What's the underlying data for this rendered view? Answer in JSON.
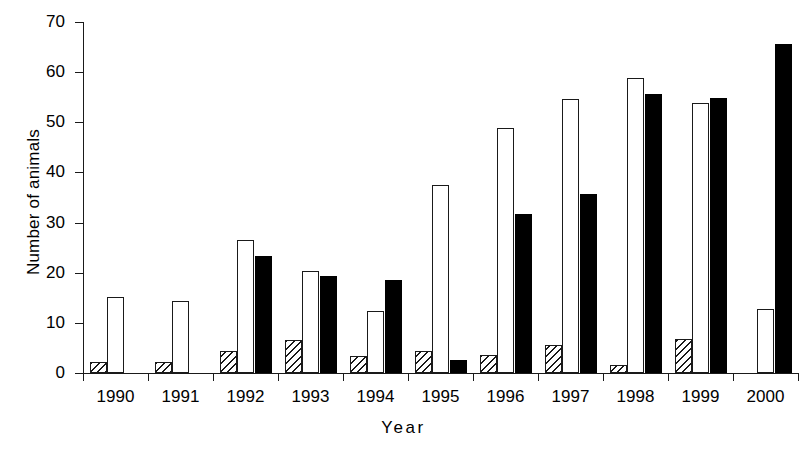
{
  "chart_data": {
    "type": "bar",
    "title": "",
    "xlabel": "Year",
    "ylabel": "Number of animals",
    "categories": [
      "1990",
      "1991",
      "1992",
      "1993",
      "1994",
      "1995",
      "1996",
      "1997",
      "1998",
      "1999",
      "2000"
    ],
    "ylim": [
      0,
      70
    ],
    "yticks": [
      0,
      10,
      20,
      30,
      40,
      50,
      60,
      70
    ],
    "ytick_labels": [
      "0",
      "10",
      "20",
      "30",
      "40",
      "50",
      "60",
      "70"
    ],
    "grid": false,
    "legend": "none",
    "series": [
      {
        "name": "hatched",
        "fill": "hatched",
        "color": "#ffffff",
        "values": [
          2.2,
          2.2,
          4.3,
          6.5,
          3.4,
          4.4,
          3.5,
          5.6,
          1.6,
          6.8,
          0
        ]
      },
      {
        "name": "white",
        "fill": "white",
        "color": "#ffffff",
        "values": [
          15.2,
          14.3,
          26.5,
          20.4,
          12.3,
          37.5,
          48.8,
          54.7,
          58.8,
          53.8,
          12.7
        ]
      },
      {
        "name": "black",
        "fill": "black",
        "color": "#000000",
        "values": [
          0,
          0,
          23.3,
          19.4,
          18.5,
          2.5,
          31.7,
          35.7,
          55.7,
          54.8,
          65.7
        ]
      }
    ]
  },
  "axis": {
    "y_title": "Number of animals",
    "x_title": "Year"
  }
}
